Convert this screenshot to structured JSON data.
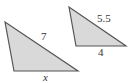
{
  "figure": {
    "colors": {
      "fill": "#d9d9d9",
      "stroke": "#555555",
      "text": "#333333"
    },
    "triangles": [
      {
        "id": "large",
        "points": "5,22 14,71 78,71",
        "labels": [
          {
            "text": "7",
            "side": "hypotenuse",
            "x": 41,
            "y": 40,
            "italic": false
          },
          {
            "text": "x",
            "side": "base",
            "x": 43,
            "y": 81,
            "italic": true
          }
        ]
      },
      {
        "id": "small",
        "points": "69,7 76,46 126,46",
        "labels": [
          {
            "text": "5.5",
            "side": "hypotenuse",
            "x": 97,
            "y": 22,
            "italic": false
          },
          {
            "text": "4",
            "side": "base",
            "x": 98,
            "y": 56,
            "italic": false
          }
        ]
      }
    ]
  }
}
